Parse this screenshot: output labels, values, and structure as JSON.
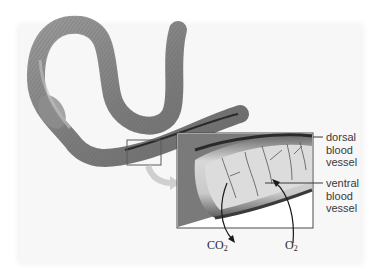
{
  "diagram": {
    "labels": {
      "dorsal": [
        "dorsal",
        "blood",
        "vessel"
      ],
      "ventral": [
        "ventral",
        "blood",
        "vessel"
      ]
    },
    "gases": {
      "co2": {
        "base": "CO",
        "sub": "2"
      },
      "o2": {
        "base": "O",
        "sub": "2"
      }
    },
    "colors": {
      "panel": "#f7f7f7",
      "worm": "#8a8a8a",
      "inset_border": "#555555",
      "text": "#3a3a3a"
    }
  }
}
